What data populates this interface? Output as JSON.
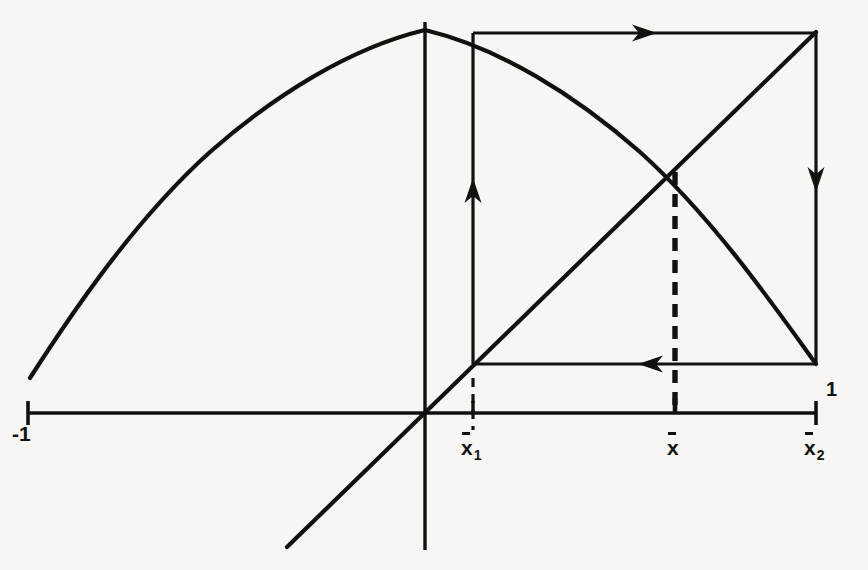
{
  "figure": {
    "kind": "cobweb-diagram",
    "title": "",
    "background_color": "#f7f6f3",
    "ink_color": "#111111",
    "width": 868,
    "height": 570
  },
  "axis": {
    "x_axis": {
      "y": 413,
      "x_start": 28,
      "x_end": 816
    },
    "y_axis": {
      "x": 425,
      "y_start": 22,
      "y_end": 550
    },
    "ticks": [
      {
        "name": "left-end",
        "x": 28,
        "label": "-1"
      },
      {
        "name": "x1",
        "x": 473,
        "label": "x",
        "subscript": "1",
        "overbar": true
      },
      {
        "name": "xbar",
        "x": 675,
        "label": "x",
        "subscript": "",
        "overbar": true
      },
      {
        "name": "x2",
        "x": 816,
        "label": "x",
        "subscript": "2",
        "overbar": true
      }
    ],
    "value_label_one": "1"
  },
  "labels": {
    "minus_one": "-1",
    "one": "1",
    "x1_base": "x",
    "x1_sub": "1",
    "xbar_base": "x",
    "x2_base": "x",
    "x2_sub": "2"
  },
  "chart_data": {
    "type": "line",
    "title": "",
    "xlabel": "",
    "ylabel": "",
    "grid": false,
    "legend": null,
    "xlim": [
      -1,
      1
    ],
    "ylim": [
      0,
      1
    ],
    "series": [
      {
        "name": "parabola-map",
        "role": "map-function",
        "style": "solid",
        "points_px": [
          [
            30,
            378
          ],
          [
            60,
            330
          ],
          [
            95,
            278
          ],
          [
            135,
            228
          ],
          [
            180,
            180
          ],
          [
            230,
            137
          ],
          [
            285,
            98
          ],
          [
            340,
            64
          ],
          [
            390,
            41
          ],
          [
            425,
            30
          ],
          [
            460,
            33
          ],
          [
            500,
            48
          ],
          [
            545,
            75
          ],
          [
            590,
            110
          ],
          [
            635,
            148
          ],
          [
            675,
            172
          ],
          [
            715,
            230
          ],
          [
            755,
            288
          ],
          [
            790,
            332
          ],
          [
            816,
            364
          ]
        ]
      },
      {
        "name": "identity-line",
        "role": "y-equals-x",
        "style": "solid",
        "points_px": [
          [
            287,
            547
          ],
          [
            425,
            413
          ],
          [
            816,
            32
          ]
        ]
      }
    ],
    "fixed_point": {
      "name": "xbar",
      "x_px": 675,
      "y_px": 172
    },
    "cobweb_path": [
      {
        "name": "vertical-up-from-x1",
        "x1": 473,
        "y1": 364,
        "x2": 473,
        "y2": 33,
        "arrow": "up",
        "arrow_at": 195,
        "style": "solid"
      },
      {
        "name": "horizontal-right-at-top",
        "x1": 473,
        "y1": 33,
        "x2": 816,
        "y2": 33,
        "arrow": "right",
        "arrow_at": 640,
        "style": "solid"
      },
      {
        "name": "vertical-down-at-x2",
        "x1": 816,
        "y1": 33,
        "x2": 816,
        "y2": 365,
        "arrow": "down",
        "arrow_at": 175,
        "style": "solid"
      },
      {
        "name": "horizontal-left-at-bottom",
        "x1": 816,
        "y1": 364,
        "x2": 473,
        "y2": 364,
        "arrow": "left",
        "arrow_at": 655,
        "style": "solid"
      }
    ],
    "dashed_lines": [
      {
        "name": "xbar-dropline",
        "x1": 675,
        "y1": 172,
        "x2": 675,
        "y2": 413,
        "style": "dashed"
      },
      {
        "name": "x1-tick-stub",
        "x1": 473,
        "y1": 398,
        "x2": 473,
        "y2": 430,
        "style": "dashed"
      }
    ]
  }
}
